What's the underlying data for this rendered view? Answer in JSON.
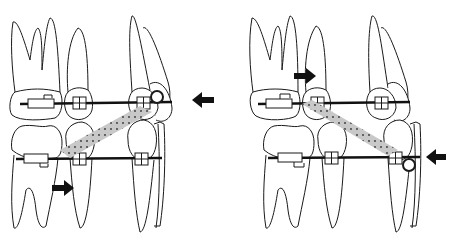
{
  "diagram": {
    "type": "orthodontic-mechanics-illustration",
    "panels": [
      {
        "id": "left",
        "description": "Class II elastic: upper canine hook to lower first molar region; upper arrow pointing left (retraction), lower arrow pointing right (mesial)",
        "upper_arrow_direction": "left",
        "lower_arrow_direction": "right"
      },
      {
        "id": "right",
        "description": "Class III elastic: upper molar region to lower canine hook; upper arrow pointing right, lower arrow pointing left",
        "upper_arrow_direction": "right",
        "lower_arrow_direction": "left"
      }
    ],
    "colors": {
      "outline": "#1a1a1a",
      "wire": "#111111",
      "elastic_fill": "#c8c8c8",
      "elastic_dots": "#333333",
      "background": "#ffffff"
    }
  }
}
